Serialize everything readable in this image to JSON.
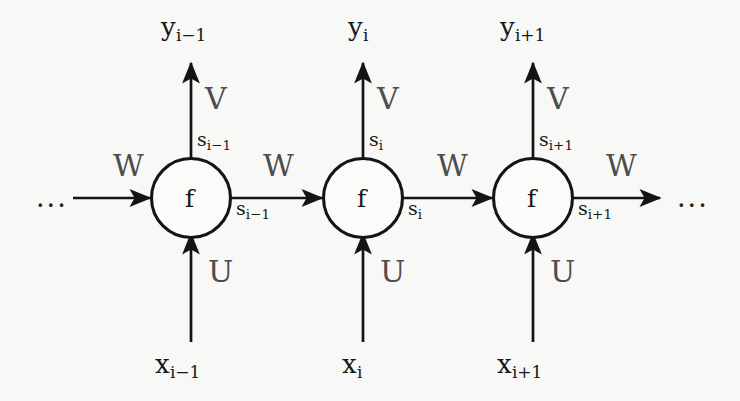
{
  "figure": {
    "type": "rnn-unfolded-computational-graph",
    "background_color": "#f8f8f7",
    "stroke_color": "#141414",
    "matrix_label_color": "#4d4d4d",
    "ellipsis_left": "...",
    "ellipsis_right": "..."
  },
  "node_glyph": {
    "f1": "f",
    "f2": "f",
    "f3": "f"
  },
  "timesteps": [
    {
      "index": "i-1",
      "output_label": "y",
      "output_sub": "i−1",
      "input_label": "x",
      "input_sub": "i−1",
      "state_top_label": "s",
      "state_top_sub": "i−1",
      "state_out_label": "s",
      "state_out_sub": "i−1",
      "output_weight": "V",
      "input_weight": "U",
      "recurrent_weight_in": "W",
      "recurrent_weight_out": "W"
    },
    {
      "index": "i",
      "output_label": "y",
      "output_sub": "i",
      "input_label": "x",
      "input_sub": "i",
      "state_top_label": "s",
      "state_top_sub": "i",
      "state_out_label": "s",
      "state_out_sub": "i",
      "output_weight": "V",
      "input_weight": "U",
      "recurrent_weight_in": "W",
      "recurrent_weight_out": "W"
    },
    {
      "index": "i+1",
      "output_label": "y",
      "output_sub": "i+1",
      "input_label": "x",
      "input_sub": "i+1",
      "state_top_label": "s",
      "state_top_sub": "i+1",
      "state_out_label": "s",
      "state_out_sub": "i+1",
      "output_weight": "V",
      "input_weight": "U",
      "recurrent_weight_in": "W",
      "recurrent_weight_out": "W"
    }
  ]
}
